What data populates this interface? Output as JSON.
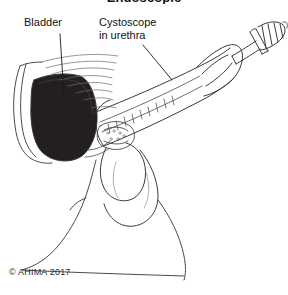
{
  "figure": {
    "title": "Endoscopic",
    "copyright": "© AHIMA 2017",
    "background_color": "#ffffff",
    "line_color": "#3a3a3a",
    "fill_dark_color": "#231f20"
  },
  "labels": [
    {
      "id": "bladder",
      "text": "Bladder",
      "leader": "vertical line descending from label into dark bladder cavity"
    },
    {
      "id": "cystoscope",
      "text": "Cystoscope\nin urethra",
      "leader": "diagonal line descending right to the cystoscope shaft"
    }
  ],
  "anatomy": {
    "parts": [
      "bladder",
      "urethra",
      "penis",
      "scrotum",
      "pubic-bone",
      "pelvic-floor",
      "thigh"
    ]
  },
  "instrument": {
    "name": "cystoscope",
    "components": [
      "shaft",
      "graduated-markings",
      "flange-ring",
      "eyepiece-barrel",
      "eyepiece-tip"
    ]
  }
}
